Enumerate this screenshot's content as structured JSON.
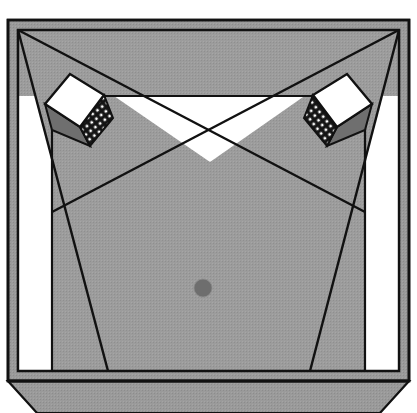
{
  "figure": {
    "width": 417,
    "height": 413,
    "background": "#ffffff"
  },
  "palette": {
    "page_background": "#ffffff",
    "outline": "#111111",
    "wall_fill": "#9a9a9a",
    "floor_fill": "#9c9c9c",
    "coverage_fill": "#9c9c9c",
    "uncovered_fill": "#ffffff",
    "speaker_body_fill": "#ffffff",
    "speaker_grille_fill": "#141414",
    "speaker_grille_dot": "#ffffff",
    "speaker_shadow_fill": "#6f6f6f",
    "listener_dot_fill": "#6e6e6e",
    "bay_fill": "#9c9c9c"
  },
  "geometry": {
    "outer_frame": {
      "name": "room-outer-wall",
      "points": "8,20 409,20 409,381 8,381"
    },
    "inner_frame": {
      "name": "room-inner-wall",
      "points": "18,30 399,30 399,371 18,371"
    },
    "floor_plate": {
      "name": "floor-plate",
      "points": "18,30 399,30 399,371 18,371"
    },
    "bay": {
      "name": "bottom-bay",
      "points": "8,381 409,381 380,413 37,413"
    },
    "coverage_left": {
      "name": "left-speaker-coverage-cone",
      "points": "18,30 210,162 108,371"
    },
    "coverage_right": {
      "name": "right-speaker-coverage-cone",
      "points": "399,30 210,162 310,371"
    },
    "uncovered_wedge": {
      "name": "uncovered-center-wedge",
      "points": "52,96 365,96 365,212 210,162 52,212"
    },
    "uncovered_left_strip": {
      "name": "uncovered-left-strip",
      "points": "18,96 52,96 52,371 18,371"
    },
    "uncovered_right_strip": {
      "name": "uncovered-right-strip",
      "points": "365,96 399,96 399,371 365,371"
    },
    "floor_band_left": {
      "name": "left-floor-band",
      "points": "52,212 210,162 108,371 52,371"
    },
    "floor_band_right": {
      "name": "right-floor-band",
      "points": "365,212 210,162 310,371 365,371"
    },
    "cross_point": {
      "name": "coverage-cross-point",
      "x": 210,
      "y": 162
    },
    "listener_dot": {
      "name": "listening-position-dot",
      "cx": 203,
      "cy": 288,
      "r": 9
    },
    "speaker_left": {
      "name": "left-loudspeaker",
      "body": "45,104 70,74 104,95 80,127",
      "grille": "80,127 104,95 113,118 90,146",
      "shadow": "45,104 80,127 90,146 52,130",
      "grille_dot_rows": 5,
      "grille_dot_cols": 5
    },
    "speaker_right": {
      "name": "right-loudspeaker",
      "body": "372,104 347,74 313,95 337,127",
      "grille": "337,127 313,95 304,118 327,146",
      "shadow": "372,104 337,127 327,146 365,130",
      "grille_dot_rows": 5,
      "grille_dot_cols": 5
    },
    "ray_left_outer": {
      "name": "left-outer-ray",
      "x1": 18,
      "y1": 30,
      "x2": 108,
      "y2": 371
    },
    "ray_left_inner": {
      "name": "left-inner-ray",
      "x1": 18,
      "y1": 30,
      "x2": 365,
      "y2": 212
    },
    "ray_right_outer": {
      "name": "right-outer-ray",
      "x1": 399,
      "y1": 30,
      "x2": 310,
      "y2": 371
    },
    "ray_right_inner": {
      "name": "right-inner-ray",
      "x1": 399,
      "y1": 30,
      "x2": 52,
      "y2": 212
    },
    "wall_line_left": {
      "name": "left-wall-line",
      "x1": 52,
      "y1": 96,
      "x2": 52,
      "y2": 371
    },
    "wall_line_right": {
      "name": "right-wall-line",
      "x1": 365,
      "y1": 96,
      "x2": 365,
      "y2": 371
    },
    "wall_line_top": {
      "name": "top-wall-line",
      "x1": 52,
      "y1": 96,
      "x2": 365,
      "y2": 96
    }
  },
  "labels": {
    "left_speaker": "Left loudspeaker",
    "right_speaker": "Right loudspeaker",
    "listener": "Listening position",
    "cross": "Coverage crossover",
    "room": "Room boundary",
    "bay": "Bay / stage extension"
  }
}
